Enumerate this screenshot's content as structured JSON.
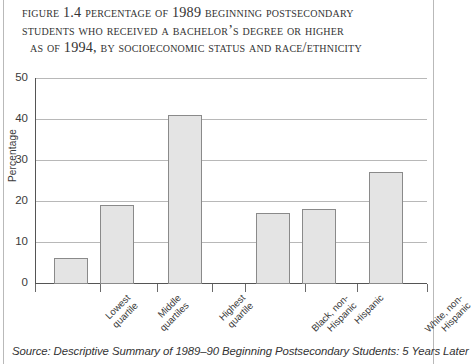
{
  "figure": {
    "title_lines": [
      "Figure 1.4  Percentage of 1989 Beginning Postsecondary",
      "Students Who Received a Bachelor’s Degree or Higher",
      "as of 1994, by Socioeconomic Status and Race/Ethnicity"
    ],
    "source_note": "Source: Descriptive Summary of 1989–90 Beginning Postsecondary Students: 5 Years Later"
  },
  "colors": {
    "bar_fill": "#e4e4e4",
    "bar_border": "#8a8a8a",
    "gridline": "#b8b8b8",
    "axis": "#555555",
    "text": "#333333"
  },
  "chart_data": {
    "type": "bar",
    "title": "Figure 1.4  Percentage of 1989 Beginning Postsecondary Students Who Received a Bachelor’s Degree or Higher as of 1994, by Socioeconomic Status and Race/Ethnicity",
    "xlabel": "",
    "ylabel": "Percentage",
    "ylim": [
      0,
      50
    ],
    "yticks": [
      0,
      10,
      20,
      30,
      40,
      50
    ],
    "ytick_labels": [
      "0",
      "10",
      "20",
      "30",
      "40",
      "50"
    ],
    "grid": true,
    "legend": false,
    "categories": [
      "Lowest quartile",
      "Middle quartiles",
      "Highest quartile",
      "Black, non-Hispanic",
      "Hispanic",
      "White, non-Hispanic"
    ],
    "category_lines": [
      [
        "Lowest",
        "quartile"
      ],
      [
        "Middle",
        "quartiles"
      ],
      [
        "Highest",
        "quartile"
      ],
      [
        "Black, non-",
        "Hispanic"
      ],
      [
        "Hispanic"
      ],
      [
        "White, non-",
        "Hispanic"
      ]
    ],
    "groups": [
      {
        "name": "Socioeconomic Status",
        "categories": [
          "Lowest quartile",
          "Middle quartiles",
          "Highest quartile"
        ]
      },
      {
        "name": "Race/Ethnicity",
        "categories": [
          "Black, non-Hispanic",
          "Hispanic",
          "White, non-Hispanic"
        ]
      }
    ],
    "values": [
      6,
      19,
      41,
      17,
      18,
      27
    ],
    "units": "percent"
  }
}
